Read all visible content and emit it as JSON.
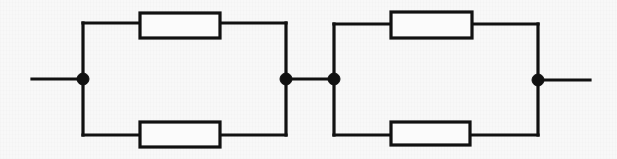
{
  "figure": {
    "caption": "",
    "width": 617,
    "height": 159,
    "background_color": "#f8f8f8",
    "line_color": "#111111",
    "component_fill": "#fbfbfb"
  },
  "diagram": {
    "type": "circuit-schematic",
    "terminals": [
      {
        "name": "left-terminal-lead",
        "x1": 32,
        "y1": 79,
        "x2": 83,
        "y2": 79
      },
      {
        "name": "right-terminal-lead",
        "x1": 538,
        "y1": 80,
        "x2": 590,
        "y2": 80
      }
    ],
    "nodes": [
      {
        "name": "node-left",
        "x": 83,
        "y": 79,
        "radius": 6
      },
      {
        "name": "node-mid-left",
        "x": 286,
        "y": 79,
        "radius": 6
      },
      {
        "name": "node-mid-right",
        "x": 334,
        "y": 79,
        "radius": 6
      },
      {
        "name": "node-right",
        "x": 538,
        "y": 80,
        "radius": 6
      }
    ],
    "link_wire": {
      "name": "mid-link-wire",
      "x1": 286,
      "y1": 79,
      "x2": 334,
      "y2": 79
    },
    "blocks": [
      {
        "name": "parallel-block-left",
        "left_rail_x": 83,
        "right_rail_x": 286,
        "top_rail_y": 23,
        "bottom_rail_y": 135,
        "node_y": 79,
        "resistors": [
          {
            "name": "resistor-top-left",
            "label": "",
            "x": 140,
            "y": 13,
            "width": 80,
            "height": 25
          },
          {
            "name": "resistor-bottom-left",
            "label": "",
            "x": 140,
            "y": 122,
            "width": 80,
            "height": 25
          }
        ]
      },
      {
        "name": "parallel-block-right",
        "left_rail_x": 334,
        "right_rail_x": 538,
        "top_rail_y": 24,
        "bottom_rail_y": 135,
        "node_y": 79,
        "resistors": [
          {
            "name": "resistor-top-right",
            "label": "",
            "x": 391,
            "y": 12,
            "width": 81,
            "height": 26
          },
          {
            "name": "resistor-bottom-right",
            "label": "",
            "x": 391,
            "y": 122,
            "width": 79,
            "height": 23
          }
        ]
      }
    ]
  }
}
